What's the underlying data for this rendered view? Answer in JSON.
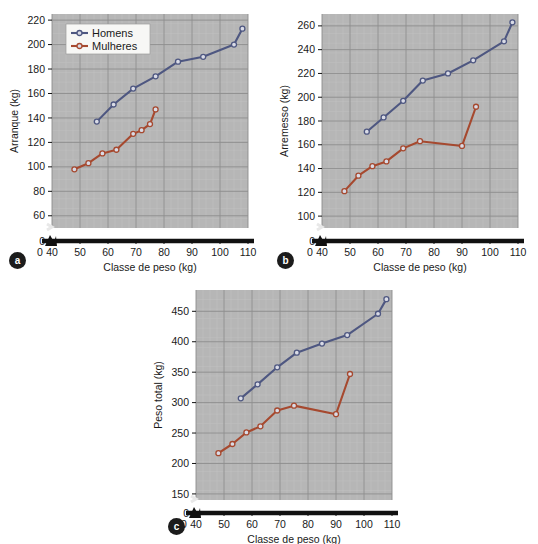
{
  "figure": {
    "panels": [
      {
        "key": "a",
        "badge": "a",
        "ylabel": "Arranque (kg)",
        "xlabel": "Classe de peso (kg)"
      },
      {
        "key": "b",
        "badge": "b",
        "ylabel": "Arremesso (kg)",
        "xlabel": "Classe de peso (kg)"
      },
      {
        "key": "c",
        "badge": "c",
        "ylabel": "Peso total (kg)",
        "xlabel": "Classe de peso (kg)"
      }
    ],
    "legend": {
      "entries": [
        {
          "label": "Homens",
          "color": "#4e5781"
        },
        {
          "label": "Mulheres",
          "color": "#a6492f"
        }
      ]
    },
    "colors": {
      "men": "#4e5781",
      "women": "#a6492f",
      "plot_background": "#b6b6b6",
      "minor_grid": "#c6c6c6",
      "major_grid": "#8d8d8d",
      "axis": "#111111",
      "page_background": "#ffffff"
    }
  },
  "chart_data": [
    {
      "type": "line",
      "panel": "a",
      "title": "",
      "xlabel": "Classe de peso (kg)",
      "ylabel": "Arranque (kg)",
      "xlim": [
        40,
        110
      ],
      "ylim": [
        50,
        225
      ],
      "xticks": [
        0,
        40,
        50,
        60,
        70,
        80,
        90,
        100,
        110
      ],
      "yticks": [
        0,
        60,
        80,
        100,
        120,
        140,
        160,
        180,
        200,
        220
      ],
      "axis_break": true,
      "grid": true,
      "legend_position": "top-left",
      "series": [
        {
          "name": "Homens",
          "color": "#4e5781",
          "x": [
            56,
            62,
            69,
            77,
            85,
            94,
            105,
            108
          ],
          "y": [
            137,
            151,
            164,
            174,
            186,
            190,
            200,
            213
          ]
        },
        {
          "name": "Mulheres",
          "color": "#a6492f",
          "x": [
            48,
            53,
            58,
            63,
            69,
            72,
            75,
            77
          ],
          "y": [
            98,
            103,
            111,
            114,
            127,
            130,
            135,
            147
          ]
        }
      ]
    },
    {
      "type": "line",
      "panel": "b",
      "title": "",
      "xlabel": "Classe de peso (kg)",
      "ylabel": "Arremesso (kg)",
      "xlim": [
        40,
        110
      ],
      "ylim": [
        90,
        270
      ],
      "xticks": [
        0,
        40,
        50,
        60,
        70,
        80,
        90,
        100,
        110
      ],
      "yticks": [
        0,
        100,
        120,
        140,
        160,
        180,
        200,
        220,
        240,
        260
      ],
      "axis_break": true,
      "grid": true,
      "legend_position": "none",
      "series": [
        {
          "name": "Homens",
          "color": "#4e5781",
          "x": [
            56,
            62,
            69,
            76,
            85,
            94,
            105,
            108
          ],
          "y": [
            171,
            183,
            197,
            214,
            220,
            231,
            247,
            263
          ]
        },
        {
          "name": "Mulheres",
          "color": "#a6492f",
          "x": [
            48,
            53,
            58,
            63,
            69,
            75,
            90,
            95
          ],
          "y": [
            121,
            134,
            142,
            146,
            157,
            163,
            159,
            192
          ]
        }
      ]
    },
    {
      "type": "line",
      "panel": "c",
      "title": "",
      "xlabel": "Classe de peso (kg)",
      "ylabel": "Peso total (kg)",
      "xlim": [
        40,
        110
      ],
      "ylim": [
        140,
        485
      ],
      "xticks": [
        0,
        40,
        50,
        60,
        70,
        80,
        90,
        100,
        110
      ],
      "yticks": [
        0,
        150,
        200,
        250,
        300,
        350,
        400,
        450
      ],
      "axis_break": true,
      "grid": true,
      "legend_position": "none",
      "series": [
        {
          "name": "Homens",
          "color": "#4e5781",
          "x": [
            56,
            62,
            69,
            76,
            85,
            94,
            105,
            108
          ],
          "y": [
            307,
            330,
            358,
            382,
            397,
            411,
            446,
            470
          ]
        },
        {
          "name": "Mulheres",
          "color": "#a6492f",
          "x": [
            48,
            53,
            58,
            63,
            69,
            75,
            90,
            95
          ],
          "y": [
            217,
            232,
            251,
            261,
            287,
            295,
            281,
            347
          ]
        }
      ]
    }
  ]
}
